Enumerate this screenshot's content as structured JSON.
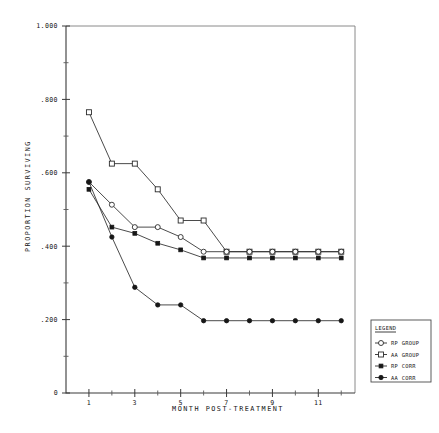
{
  "chart_data": {
    "type": "line",
    "title": "",
    "xlabel": "MONTH POST-TREATMENT",
    "ylabel": "PROPORTION SURVIVING",
    "xlim": [
      0,
      12.6
    ],
    "ylim": [
      0,
      1.0
    ],
    "grid": false,
    "legend_position": "right-outside",
    "legend_title": "LEGEND",
    "x_ticks_major": [
      1,
      3,
      5,
      7,
      9,
      11
    ],
    "x_tick_labels": [
      "1",
      "3",
      "5",
      "7",
      "9",
      "11"
    ],
    "x_ticks_minor": [
      2,
      4,
      6,
      8,
      10,
      12
    ],
    "y_ticks_major": [
      0.0,
      0.2,
      0.4,
      0.6,
      0.8,
      1.0
    ],
    "y_tick_labels": [
      "0",
      ".200",
      ".400",
      ".600",
      ".800",
      "1.000"
    ],
    "y_ticks_minor": [
      0.1,
      0.3,
      0.5,
      0.7,
      0.9
    ],
    "x": [
      1,
      2,
      3,
      4,
      5,
      6,
      7,
      8,
      9,
      10,
      11,
      12
    ],
    "series": [
      {
        "name": "RP GROUP",
        "marker": "open-square",
        "values": [
          0.765,
          0.625,
          0.625,
          0.555,
          0.47,
          0.47,
          0.385,
          0.385,
          0.385,
          0.385,
          0.385,
          0.385
        ]
      },
      {
        "name": "AA GROUP",
        "marker": "open-circle",
        "values": [
          0.575,
          0.513,
          0.452,
          0.452,
          0.425,
          0.385,
          0.385,
          0.385,
          0.385,
          0.385,
          0.385,
          0.385
        ]
      },
      {
        "name": "RP CORR",
        "marker": "solid-square",
        "values": [
          0.555,
          0.452,
          0.435,
          0.408,
          0.39,
          0.368,
          0.368,
          0.368,
          0.368,
          0.368,
          0.368,
          0.368
        ]
      },
      {
        "name": "AA CORR",
        "marker": "solid-circle",
        "values": [
          0.575,
          0.425,
          0.288,
          0.24,
          0.24,
          0.197,
          0.197,
          0.197,
          0.197,
          0.197,
          0.197,
          0.197
        ]
      }
    ]
  },
  "legend": {
    "title": "LEGEND",
    "entries": [
      {
        "label": "RP GROUP",
        "marker": "open-circle-line"
      },
      {
        "label": "AA GROUP",
        "marker": "open-square-line"
      },
      {
        "label": "RP CORR",
        "marker": "solid-square-line"
      },
      {
        "label": "AA CORR",
        "marker": "solid-circle-line"
      }
    ]
  },
  "colors": {
    "ink": "#1a1a1a",
    "frame": "#7d7d7d",
    "background": "#ffffff"
  }
}
